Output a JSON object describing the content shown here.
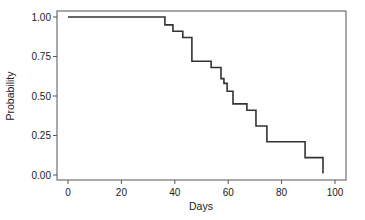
{
  "chart_data": {
    "type": "line",
    "subtype": "step (Kaplan-Meier survival curve)",
    "title": "",
    "xlabel": "Days",
    "ylabel": "Probability",
    "xlim": [
      0,
      100
    ],
    "ylim": [
      0,
      1
    ],
    "xticks": [
      0,
      20,
      40,
      60,
      80,
      100
    ],
    "yticks": [
      0.0,
      0.25,
      0.5,
      0.75,
      1.0
    ],
    "xtick_labels": [
      "0",
      "20",
      "40",
      "60",
      "80",
      "100"
    ],
    "ytick_labels": [
      "0.00",
      "0.25",
      "0.50",
      "0.75",
      "1.00"
    ],
    "grid": false,
    "legend": null,
    "series": [
      {
        "name": "Survival",
        "color": "#333333",
        "steps": [
          {
            "x": 0,
            "y": 1.0
          },
          {
            "x": 36.3,
            "y": 0.95
          },
          {
            "x": 39.3,
            "y": 0.91
          },
          {
            "x": 43.0,
            "y": 0.87
          },
          {
            "x": 46.4,
            "y": 0.72
          },
          {
            "x": 53.6,
            "y": 0.68
          },
          {
            "x": 57.3,
            "y": 0.61
          },
          {
            "x": 58.4,
            "y": 0.58
          },
          {
            "x": 59.6,
            "y": 0.53
          },
          {
            "x": 61.8,
            "y": 0.45
          },
          {
            "x": 67.0,
            "y": 0.41
          },
          {
            "x": 70.4,
            "y": 0.31
          },
          {
            "x": 74.5,
            "y": 0.21
          },
          {
            "x": 88.8,
            "y": 0.11
          },
          {
            "x": 95.5,
            "y": 0.01
          }
        ]
      }
    ]
  },
  "labels": {
    "xlabel": "Days",
    "ylabel": "Probability"
  }
}
